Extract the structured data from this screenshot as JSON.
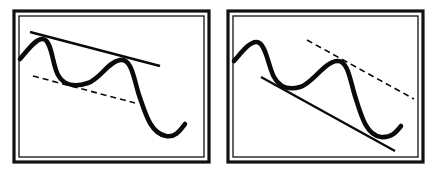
{
  "diagram": {
    "panels": [
      {
        "id": "left",
        "trendline": "solid line connecting two peaks (upper, descending)",
        "channel_line": "dashed parallel line through trough (lower)"
      },
      {
        "id": "right",
        "trendline": "solid line connecting two troughs (lower, descending)",
        "channel_line": "dashed parallel line through peak (upper)"
      }
    ],
    "colors": {
      "ink": "#0a0a0a",
      "background": "#ffffff"
    }
  }
}
